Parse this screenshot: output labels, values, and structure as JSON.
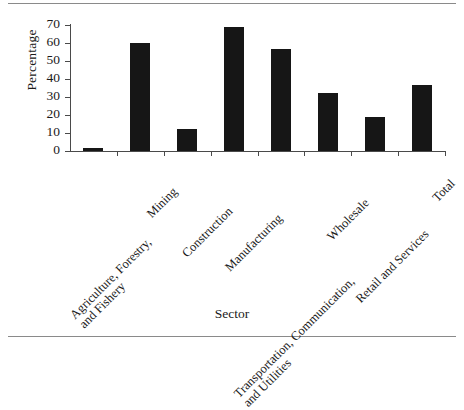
{
  "figure": {
    "y_axis_title": "Percentage",
    "x_axis_title": "Sector",
    "bar_color": "#161616",
    "axis_color": "#4a4a4a",
    "rule_color": "#8a8a8a"
  },
  "chart_data": {
    "type": "bar",
    "title": "",
    "xlabel": "Sector",
    "ylabel": "Percentage",
    "ylim": [
      0,
      70
    ],
    "yticks": [
      0,
      10,
      20,
      30,
      40,
      50,
      60,
      70
    ],
    "ytick_labels": [
      "0",
      "10",
      "20",
      "30",
      "40",
      "50",
      "60",
      "70"
    ],
    "grid": false,
    "legend": "none",
    "categories": [
      "Agriculture, Forestry,\nand Fishery",
      "Mining",
      "Construction",
      "Manufacturing",
      "Transportation, Communication,\nand Utilities",
      "Wholesale",
      "Retail and Services",
      "Total"
    ],
    "category_lines": [
      [
        "Agriculture, Forestry,",
        "and Fishery"
      ],
      [
        "Mining"
      ],
      [
        "Construction"
      ],
      [
        "Manufacturing"
      ],
      [
        "Transportation, Communication,",
        "and Utilities"
      ],
      [
        "Wholesale"
      ],
      [
        "Retail and Services"
      ],
      [
        "Total"
      ]
    ],
    "values": [
      1.7,
      60,
      12.2,
      69,
      56.7,
      32.2,
      19,
      36.7
    ]
  }
}
